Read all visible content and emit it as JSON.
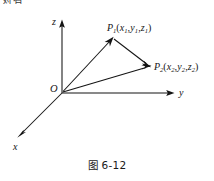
{
  "page": {
    "header_fragment": "对有"
  },
  "figure": {
    "caption": "图 6-12",
    "axes": [
      {
        "name": "z",
        "label": "z"
      },
      {
        "name": "y",
        "label": "y"
      },
      {
        "name": "x",
        "label": "x"
      }
    ],
    "origin": {
      "label": "O"
    },
    "points": [
      {
        "name": "P1",
        "base": "P",
        "index": "1",
        "open_paren": "(",
        "coords": [
          {
            "sym": "x",
            "sub": "1"
          },
          {
            "sym": "y",
            "sub": "1"
          },
          {
            "sym": "z",
            "sub": "1"
          }
        ],
        "separator": ",",
        "close_paren": ")",
        "full_text": "P₁(x₁, y₁, z₁)"
      },
      {
        "name": "P2",
        "base": "P",
        "index": "2",
        "open_paren": "(",
        "coords": [
          {
            "sym": "x",
            "sub": "2"
          },
          {
            "sym": "y",
            "sub": "2"
          },
          {
            "sym": "z",
            "sub": "2"
          }
        ],
        "separator": ",",
        "close_paren": ")",
        "full_text": "P₂(x₂, y₂, z₂)"
      }
    ],
    "vectors": [
      {
        "name": "O-to-P1",
        "from": "O",
        "to": "P1"
      },
      {
        "name": "O-to-P2",
        "from": "O",
        "to": "P2"
      },
      {
        "name": "P1-to-P2",
        "from": "P1",
        "to": "P2"
      }
    ],
    "colors": {
      "stroke": "#141414",
      "background": "#ffffff"
    }
  }
}
